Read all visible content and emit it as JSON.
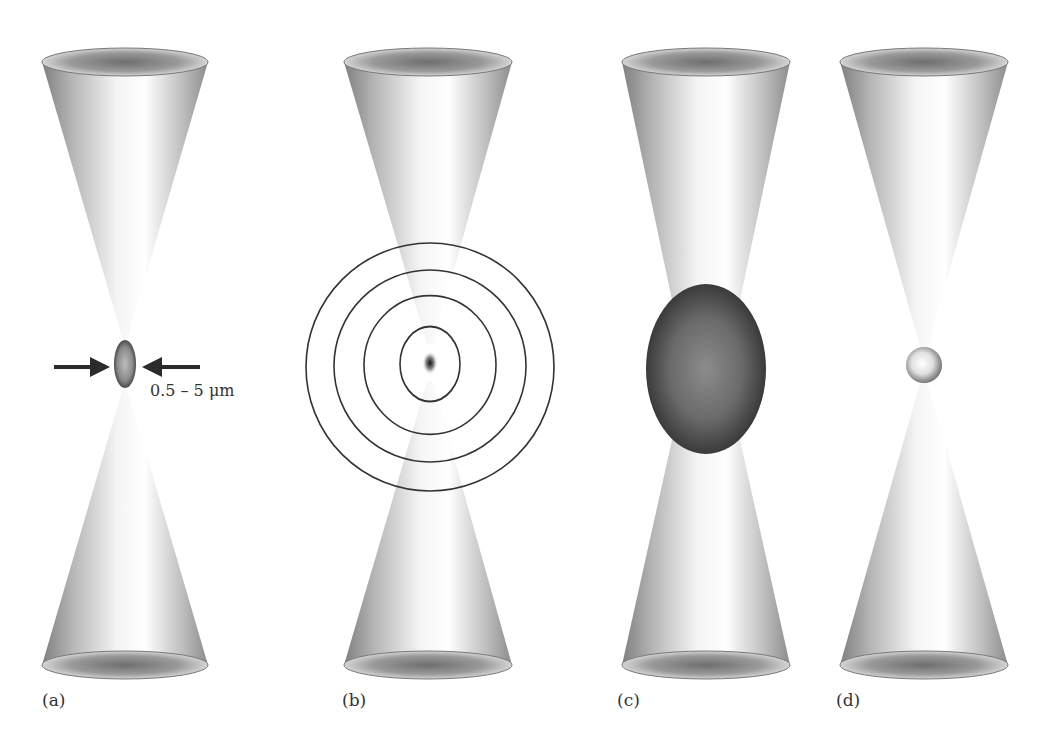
{
  "figure": {
    "panels": [
      {
        "id": "a",
        "label": "(a)",
        "description": "Focused laser beam with small ellipsoidal focal volume",
        "annotation": "0.5 – 5 μm"
      },
      {
        "id": "b",
        "label": "(b)",
        "description": "Focused beam with concentric circles radiating from focal point"
      },
      {
        "id": "c",
        "label": "(c)",
        "description": "Focused beam with large dark ellipsoid at focus"
      },
      {
        "id": "d",
        "label": "(d)",
        "description": "Focused beam with small bright sphere at focus"
      }
    ],
    "colors": {
      "cone_light": "#f2f2f2",
      "cone_dark": "#8a8a8a",
      "ring_stroke": "#333333",
      "arrow": "#2b2b2b",
      "ellipsoid_c": "#4a4a4a"
    }
  }
}
